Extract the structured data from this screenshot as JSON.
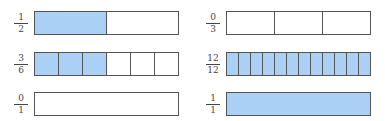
{
  "colors": {
    "shaded": "#aad0f5",
    "border": "#555555"
  },
  "bars": [
    {
      "numerator": "1",
      "denominator": "2",
      "parts": 2,
      "shaded": 1,
      "x": 34,
      "y": 11
    },
    {
      "numerator": "0",
      "denominator": "3",
      "parts": 3,
      "shaded": 0,
      "x": 226,
      "y": 11
    },
    {
      "numerator": "3",
      "denominator": "6",
      "parts": 6,
      "shaded": 3,
      "x": 34,
      "y": 52
    },
    {
      "numerator": "12",
      "denominator": "12",
      "parts": 12,
      "shaded": 12,
      "x": 226,
      "y": 52
    },
    {
      "numerator": "0",
      "denominator": "1",
      "parts": 1,
      "shaded": 0,
      "x": 34,
      "y": 92
    },
    {
      "numerator": "1",
      "denominator": "1",
      "parts": 1,
      "shaded": 1,
      "x": 226,
      "y": 92
    }
  ]
}
